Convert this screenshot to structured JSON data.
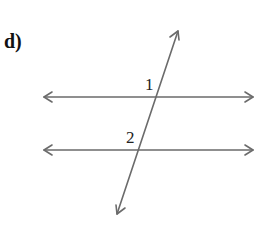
{
  "problem": {
    "label": "d)"
  },
  "diagram": {
    "line_color": "#6b6b6b",
    "text_color": "#222222",
    "parallel_lines": [
      {
        "name": "upper",
        "x1": 44,
        "x2": 253,
        "y": 97
      },
      {
        "name": "lower",
        "x1": 44,
        "x2": 253,
        "y": 150
      }
    ],
    "transversal": {
      "x1": 117,
      "y1": 214,
      "x2": 178,
      "y2": 31
    },
    "angles": [
      {
        "label": "1",
        "x": 145,
        "y": 90
      },
      {
        "label": "2",
        "x": 126,
        "y": 143
      }
    ]
  }
}
